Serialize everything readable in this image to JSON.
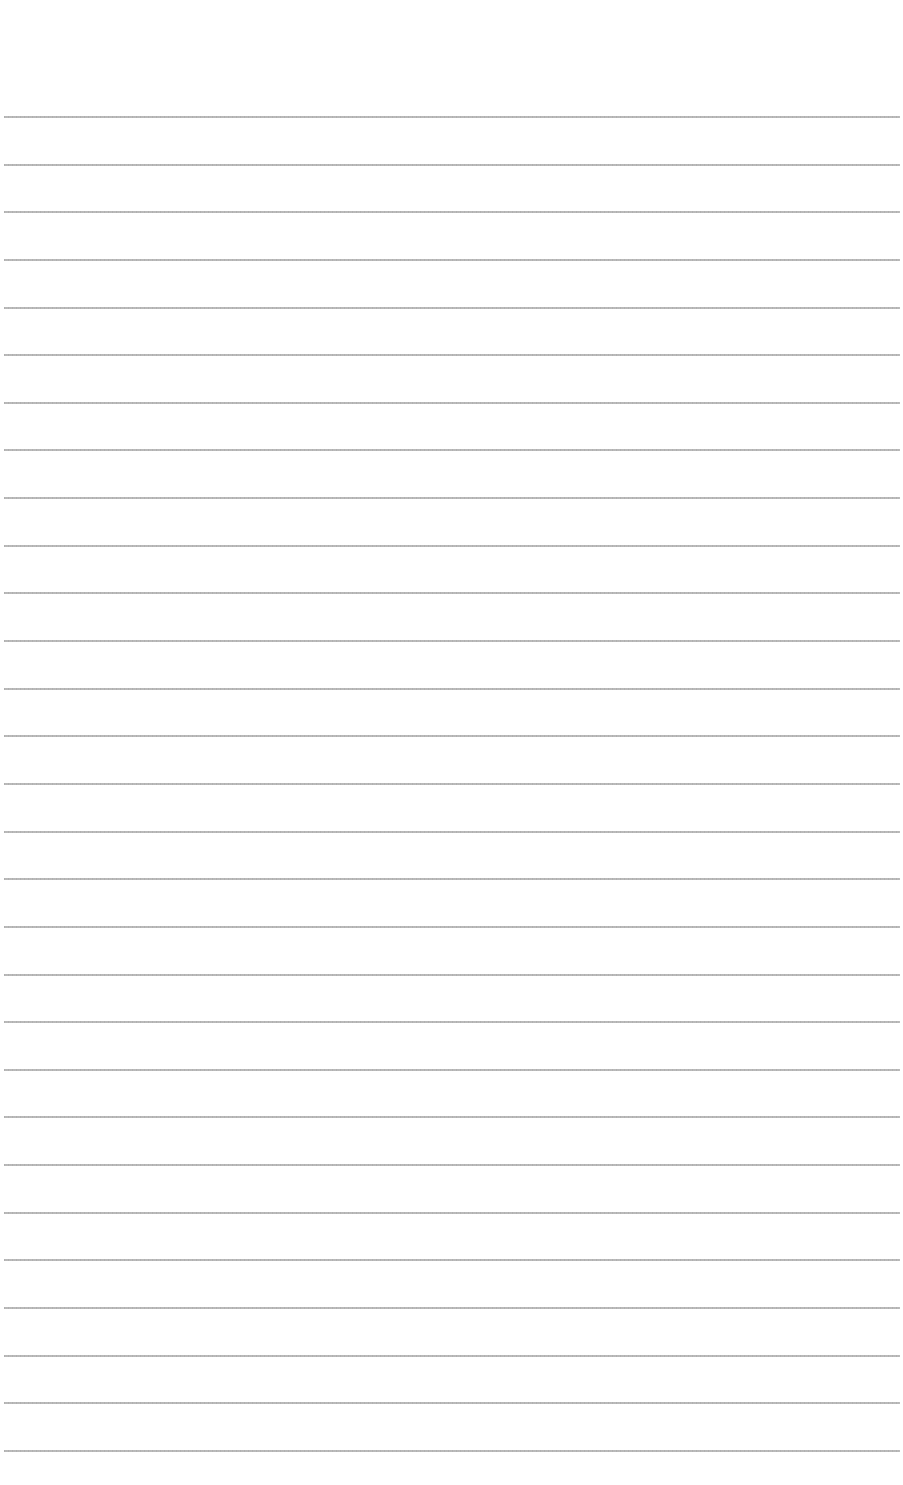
{
  "document": {
    "type": "blank ruled paper",
    "background_color": "#ffffff",
    "rule_color": "#a8a8a8",
    "rules": {
      "count": 29,
      "first_y": 116,
      "spacing": 47.64,
      "x_start": 4,
      "x_end": 900
    },
    "text": ""
  }
}
